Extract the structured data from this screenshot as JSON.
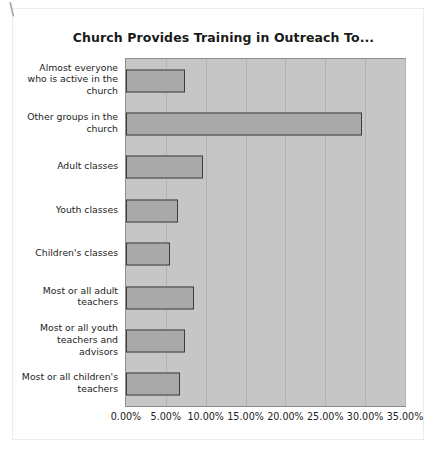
{
  "decorations": {
    "corner_mark": "\\"
  },
  "chart_data": {
    "type": "bar",
    "orientation": "horizontal",
    "title": "Church Provides Training in Outreach To...",
    "xlabel": "",
    "ylabel": "",
    "xlim": [
      0,
      35
    ],
    "grid": true,
    "legend": "none",
    "tick_labels": [
      "0.00%",
      "5.00%",
      "10.00%",
      "15.00%",
      "20.00%",
      "25.00%",
      "30.00%",
      "35.00%"
    ],
    "tick_values": [
      0,
      5,
      10,
      15,
      20,
      25,
      30,
      35
    ],
    "categories": [
      "Almost everyone who is active in the church",
      "Other groups in the church",
      "Adult classes",
      "Youth classes",
      "Children's classes",
      "Most or all adult teachers",
      "Most or all youth teachers and advisors",
      "Most or all children's teachers"
    ],
    "category_lines": [
      [
        "Almost everyone",
        "who is active in the",
        "church"
      ],
      [
        "Other groups in the",
        "church"
      ],
      [
        "Adult classes"
      ],
      [
        "Youth classes"
      ],
      [
        "Children's classes"
      ],
      [
        "Most or all adult",
        "teachers"
      ],
      [
        "Most or all youth",
        "teachers and",
        "advisors"
      ],
      [
        "Most or all children's",
        "teachers"
      ]
    ],
    "values": [
      7.4,
      29.6,
      9.6,
      6.5,
      5.5,
      8.5,
      7.4,
      6.8
    ],
    "value_labels": [
      "7.40%",
      "29.60%",
      "9.60%",
      "6.50%",
      "5.50%",
      "8.50%",
      "7.40%",
      "6.80%"
    ],
    "colors": {
      "bar_fill": "#a9a9a9",
      "bar_border": "#3d3d3d",
      "plot_background": "#c6c6c6",
      "gridline": "#b4b4b4",
      "page_background": "#ffffff",
      "text": "#1c1c1c"
    }
  }
}
